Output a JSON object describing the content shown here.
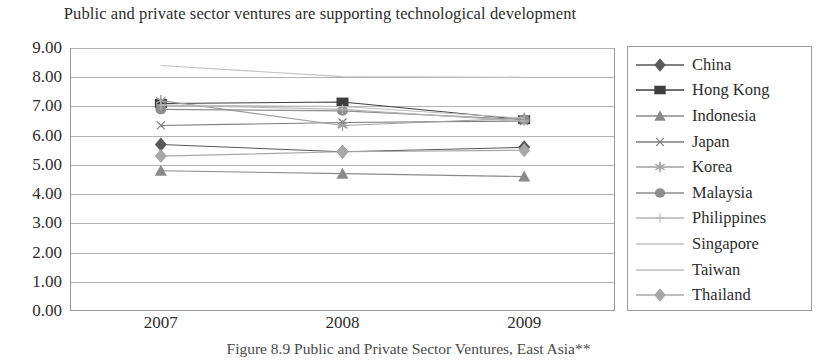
{
  "chart_data": {
    "type": "line",
    "title": "Public and private sector ventures are supporting technological development",
    "xlabel": "",
    "ylabel": "",
    "categories": [
      "2007",
      "2008",
      "2009"
    ],
    "x_tick_labels": [
      "2007",
      "2008",
      "2009"
    ],
    "y_tick_labels": [
      "0.00",
      "1.00",
      "2.00",
      "3.00",
      "4.00",
      "5.00",
      "6.00",
      "7.00",
      "8.00",
      "9.00"
    ],
    "ylim": [
      0,
      9
    ],
    "y_step": 1,
    "grid": true,
    "legend_position": "right",
    "series": [
      {
        "name": "China",
        "marker": "diamond",
        "color": "#595959",
        "values": [
          5.7,
          5.45,
          5.6
        ]
      },
      {
        "name": "Hong Kong",
        "marker": "square",
        "color": "#3f3f3f",
        "values": [
          7.1,
          7.15,
          6.55
        ]
      },
      {
        "name": "Indonesia",
        "marker": "triangle",
        "color": "#8a8a8a",
        "values": [
          4.8,
          4.7,
          4.6
        ]
      },
      {
        "name": "Japan",
        "marker": "x",
        "color": "#7d7d7d",
        "values": [
          6.35,
          6.45,
          6.5
        ]
      },
      {
        "name": "Korea",
        "marker": "star",
        "color": "#a0a0a0",
        "values": [
          7.2,
          6.35,
          6.6
        ]
      },
      {
        "name": "Malaysia",
        "marker": "circle",
        "color": "#8e8e8e",
        "values": [
          6.9,
          6.85,
          6.55
        ]
      },
      {
        "name": "Philippines",
        "marker": "plus",
        "color": "#b5b5b5",
        "values": [
          7.05,
          6.9,
          6.5
        ]
      },
      {
        "name": "Singapore",
        "marker": "none",
        "color": "#c2c2c2",
        "values": [
          8.4,
          8.02,
          8.0
        ]
      },
      {
        "name": "Taiwan",
        "marker": "none",
        "color": "#bdbdbd",
        "values": [
          7.05,
          7.0,
          6.6
        ]
      },
      {
        "name": "Thailand",
        "marker": "diamond2",
        "color": "#a8a8a8",
        "values": [
          5.3,
          5.45,
          5.5
        ]
      }
    ]
  },
  "caption": "Figure 8.9   Public and Private Sector Ventures, East Asia**"
}
